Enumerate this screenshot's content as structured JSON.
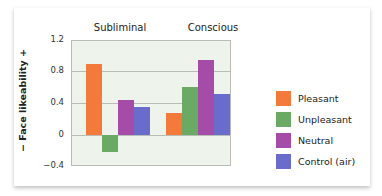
{
  "chart_data": {
    "type": "bar",
    "title": "",
    "categories": [
      "Subliminal",
      "Conscious"
    ],
    "series": [
      {
        "name": "Pleasant",
        "color": "#f47a3c",
        "values": [
          0.89,
          0.27
        ]
      },
      {
        "name": "Unpleasant",
        "color": "#6aaa64",
        "values": [
          -0.22,
          0.61
        ]
      },
      {
        "name": "Neutral",
        "color": "#a54ca8",
        "values": [
          0.44,
          0.95
        ]
      },
      {
        "name": "Control (air)",
        "color": "#6a6ccc",
        "values": [
          0.35,
          0.52
        ]
      }
    ],
    "xlabel": "",
    "ylabel": "− Face likeability +",
    "ylim": [
      -0.4,
      1.2
    ],
    "yticks": [
      "1.2",
      "0.8",
      "0.4",
      "0",
      "−0.4"
    ],
    "grid": true,
    "legend_position": "right"
  }
}
